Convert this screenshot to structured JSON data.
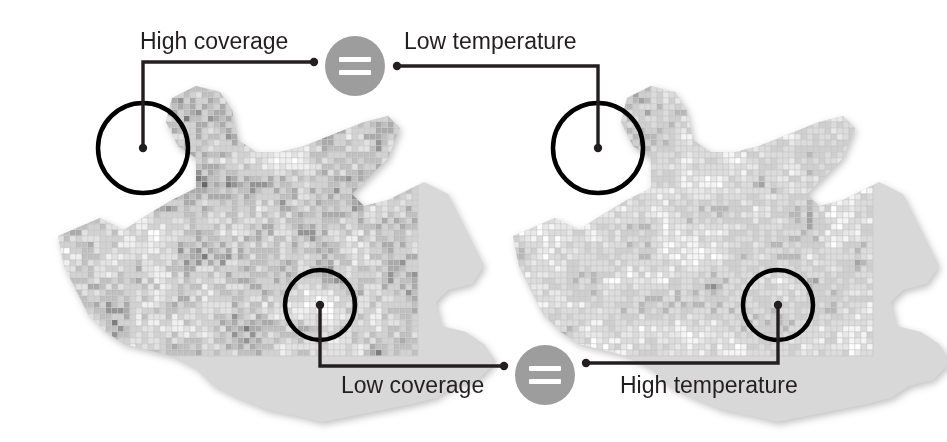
{
  "figure": {
    "type": "annotated-choropleth-pair",
    "background": "#ffffff",
    "width": 947,
    "height": 442
  },
  "annotations": {
    "top_left": {
      "label": "High coverage",
      "label_x": 140,
      "label_y": 28,
      "dot_x": 143,
      "dot_y": 148,
      "elbow_x": 143,
      "elbow_y": 62,
      "end_x": 314,
      "end_y": 62
    },
    "top_right": {
      "label": "Low temperature",
      "label_x": 404,
      "label_y": 28,
      "dot_x": 598,
      "dot_y": 148,
      "elbow_x": 598,
      "elbow_y": 66,
      "end_x": 397,
      "end_y": 66
    },
    "bottom_left": {
      "label": "Low coverage",
      "label_x": 341,
      "label_y": 372,
      "dot_x": 320,
      "dot_y": 305,
      "elbow_x": 320,
      "elbow_y": 366,
      "end_x": 504,
      "end_y": 366
    },
    "bottom_right": {
      "label": "High temperature",
      "label_x": 620,
      "label_y": 372,
      "dot_x": 778,
      "dot_y": 305,
      "elbow_x": 778,
      "elbow_y": 363,
      "end_x": 586,
      "end_y": 363
    }
  },
  "equals_icons": [
    {
      "name": "equals-icon-top",
      "cx": 355,
      "cy": 66,
      "r": 30,
      "circle_color": "#9d9d9d",
      "bar_color": "#ffffff",
      "glyph": "="
    },
    {
      "name": "equals-icon-bottom",
      "cx": 545,
      "cy": 375,
      "r": 30,
      "circle_color": "#9d9d9d",
      "bar_color": "#ffffff",
      "glyph": "="
    }
  ],
  "maps": [
    {
      "name": "coverage-map",
      "variable": "coverage",
      "origin_x": 40,
      "origin_y": 86,
      "cell": 6,
      "cols": 63,
      "rows": 45,
      "palette": [
        "#ffffff",
        "#f0f0f0",
        "#e2e2e2",
        "#d2d2d2",
        "#c0c0c0",
        "#ababab",
        "#949494",
        "#7d7d7d",
        "#666666"
      ],
      "weights": [
        10,
        13,
        15,
        16,
        14,
        12,
        9,
        7,
        4
      ],
      "hotspots": [
        {
          "cx": 17,
          "cy": 11,
          "r": 5,
          "shift": 3
        },
        {
          "cx": 47,
          "cy": 37,
          "r": 5,
          "shift": -3
        }
      ],
      "markers": [
        {
          "name": "marker-high-coverage",
          "cx": 143,
          "cy": 148,
          "r": 45
        },
        {
          "name": "marker-low-coverage",
          "cx": 320,
          "cy": 305,
          "r": 35
        }
      ]
    },
    {
      "name": "temperature-map",
      "variable": "temperature",
      "origin_x": 495,
      "origin_y": 86,
      "cell": 6,
      "cols": 63,
      "rows": 45,
      "palette": [
        "#ffffff",
        "#f5f5f5",
        "#e8e8e8",
        "#dcdcdc",
        "#cfcfcf",
        "#b8b8b8",
        "#a3a3a3",
        "#8e8e8e"
      ],
      "weights": [
        16,
        10,
        8,
        22,
        20,
        12,
        8,
        4
      ],
      "hotspots": [
        {
          "cx": 17,
          "cy": 11,
          "r": 5,
          "shift": 2
        },
        {
          "cx": 47,
          "cy": 37,
          "r": 5,
          "shift": 3
        }
      ],
      "markers": [
        {
          "name": "marker-low-temperature",
          "cx": 598,
          "cy": 148,
          "r": 45
        },
        {
          "name": "marker-high-temperature",
          "cx": 778,
          "cy": 305,
          "r": 35
        }
      ]
    }
  ],
  "map_outline": [
    [
      3,
      25
    ],
    [
      10,
      22
    ],
    [
      14,
      24
    ],
    [
      17,
      22
    ],
    [
      22,
      19
    ],
    [
      26,
      17
    ],
    [
      26,
      12
    ],
    [
      23,
      10
    ],
    [
      21,
      6
    ],
    [
      22,
      2
    ],
    [
      26,
      0
    ],
    [
      30,
      1
    ],
    [
      32,
      4
    ],
    [
      33,
      9
    ],
    [
      36,
      11
    ],
    [
      40,
      11
    ],
    [
      44,
      10
    ],
    [
      49,
      8
    ],
    [
      54,
      6
    ],
    [
      58,
      5
    ],
    [
      60,
      7
    ],
    [
      58,
      12
    ],
    [
      55,
      15
    ],
    [
      52,
      18
    ],
    [
      54,
      20
    ],
    [
      58,
      19
    ],
    [
      62,
      17
    ],
    [
      64,
      16
    ],
    [
      68,
      18
    ],
    [
      70,
      22
    ],
    [
      72,
      26
    ],
    [
      74,
      30
    ],
    [
      72,
      33
    ],
    [
      68,
      34
    ],
    [
      66,
      36
    ],
    [
      67,
      40
    ],
    [
      71,
      41
    ],
    [
      74,
      43
    ],
    [
      76,
      46
    ],
    [
      73,
      49
    ],
    [
      69,
      50
    ],
    [
      66,
      52
    ],
    [
      62,
      53
    ],
    [
      57,
      54
    ],
    [
      52,
      55
    ],
    [
      47,
      56
    ],
    [
      43,
      55
    ],
    [
      38,
      54
    ],
    [
      33,
      52
    ],
    [
      29,
      50
    ],
    [
      26,
      47
    ],
    [
      22,
      45
    ],
    [
      18,
      44
    ],
    [
      14,
      43
    ],
    [
      11,
      41
    ],
    [
      8,
      38
    ],
    [
      6,
      34
    ],
    [
      4,
      30
    ]
  ],
  "stroke": {
    "connector_color": "#231f20",
    "connector_width": 3.4,
    "dot_radius": 4.2,
    "marker_color": "#000000",
    "marker_width": 4.5
  },
  "text_color": "#231f20"
}
